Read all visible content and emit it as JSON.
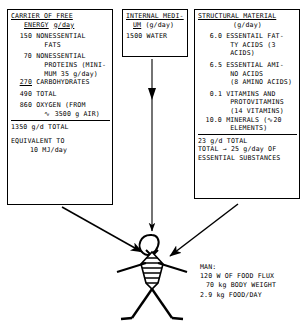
{
  "diagram": {
    "boxes": {
      "energy": {
        "header_line1": "CARRIER OF FREE",
        "header_line2": "ENERGY",
        "header_units": "g/day",
        "rows": [
          {
            "value": "150",
            "text_lines": [
              "NONESSENTIAL",
              "FATS"
            ]
          },
          {
            "value": "70",
            "text_lines": [
              "NONESSENTIAL",
              "PROTEINS (MINI-",
              "MUM 35 g/day)"
            ]
          },
          {
            "value": "270",
            "text_lines": [
              "CARBOHYDRATES"
            ],
            "underlined": true
          }
        ],
        "subtotal": {
          "value": "490",
          "label": "TOTAL"
        },
        "oxygen": {
          "value": "860",
          "text_lines": [
            "OXYGEN (FROM",
            "∿ 3500 g AIR)"
          ]
        },
        "total": "1350 g/d TOTAL",
        "equivalent_line1": "EQUIVALENT TO",
        "equivalent_line2": "10 MJ/day"
      },
      "medium": {
        "header_line1": "INTERNAL MEDI-",
        "header_line2": "UM",
        "header_units": "(g/day)",
        "rows": [
          {
            "value": "1500",
            "text": "WATER"
          }
        ]
      },
      "structural": {
        "header_line1": "STRUCTURAL MATERIAL",
        "header_units": "(g/day)",
        "rows": [
          {
            "value": "6.0",
            "text_lines": [
              "ESSENTAIL FAT-",
              "TY ACIDS (3",
              "ACIDS)"
            ]
          },
          {
            "value": "6.5",
            "text_lines": [
              "ESSENTIAL AMI-",
              "NO ACIDS",
              "(8 AMINO ACIDS)"
            ]
          },
          {
            "value": "0.1",
            "text_lines": [
              "VITAMINS AND",
              "PROTOVITAMINS",
              "(14 VITAMINS)"
            ]
          },
          {
            "value": "10.0",
            "text_lines": [
              "MINERALS (∿20",
              "ELEMENTS)"
            ]
          }
        ],
        "total_line1": "23 g/d TOTAL",
        "total_line2": "TOTAL → 25 g/day OF",
        "total_line3": "ESSENTIAL SUBSTANCES"
      }
    },
    "man": {
      "caption_title": "MAN:",
      "caption_lines": [
        "120 W OF FOOD FLUX",
        "70 kg BODY WEIGHT",
        "2.9 kg FOOD/DAY"
      ]
    },
    "colors": {
      "ink": "#000000",
      "paper": "#ffffff"
    }
  }
}
